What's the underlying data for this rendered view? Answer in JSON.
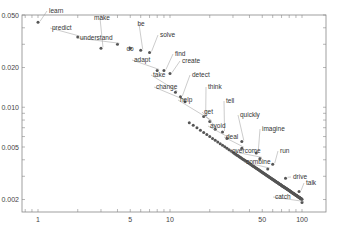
{
  "chart_data": {
    "type": "scatter",
    "title": "",
    "xlabel": "",
    "ylabel": "",
    "xscale": "log",
    "yscale": "log",
    "xlim": [
      0.78,
      130
    ],
    "ylim": [
      0.0014,
      0.066
    ],
    "grid": false,
    "x_ticks": [
      {
        "v": 1,
        "label": "1"
      },
      {
        "v": 5,
        "label": "5"
      },
      {
        "v": 10,
        "label": "10"
      },
      {
        "v": 50,
        "label": "50"
      },
      {
        "v": 100,
        "label": "100"
      }
    ],
    "y_ticks": [
      {
        "v": 0.05,
        "label": "0.050"
      },
      {
        "v": 0.02,
        "label": "0.020"
      },
      {
        "v": 0.01,
        "label": "0.010"
      },
      {
        "v": 0.005,
        "label": "0.005"
      },
      {
        "v": 0.002,
        "label": "0.002"
      }
    ],
    "point_color": "#555555",
    "series": [
      {
        "name": "words",
        "x_range": [
          1,
          100
        ],
        "approx_law": "y ≈ 0.046 * x^-0.68"
      }
    ],
    "labeled_points": [
      {
        "word": "learn",
        "x": 1,
        "y": 0.044,
        "lx": 49,
        "ly": 13,
        "anchor": "start"
      },
      {
        "word": "predict",
        "x": 2,
        "y": 0.034,
        "lx": 52,
        "ly": 30,
        "anchor": "start"
      },
      {
        "word": "make",
        "x": 3,
        "y": 0.028,
        "lx": 102,
        "ly": 20,
        "anchor": "middle"
      },
      {
        "word": "understand",
        "x": 4,
        "y": 0.03,
        "lx": 80,
        "ly": 40,
        "anchor": "start"
      },
      {
        "word": "do",
        "x": 5,
        "y": 0.028,
        "lx": 130,
        "ly": 51,
        "anchor": "middle"
      },
      {
        "word": "be",
        "x": 6,
        "y": 0.027,
        "lx": 141,
        "ly": 26,
        "anchor": "middle"
      },
      {
        "word": "solve",
        "x": 7,
        "y": 0.026,
        "lx": 160,
        "ly": 37,
        "anchor": "start"
      },
      {
        "word": "adapt",
        "x": 8,
        "y": 0.019,
        "lx": 134,
        "ly": 62,
        "anchor": "start"
      },
      {
        "word": "find",
        "x": 9,
        "y": 0.019,
        "lx": 175,
        "ly": 56,
        "anchor": "start"
      },
      {
        "word": "create",
        "x": 10,
        "y": 0.018,
        "lx": 182,
        "ly": 63,
        "anchor": "start"
      },
      {
        "word": "take",
        "x": 11,
        "y": 0.013,
        "lx": 153,
        "ly": 77,
        "anchor": "start"
      },
      {
        "word": "detect",
        "x": 12,
        "y": 0.012,
        "lx": 192,
        "ly": 77,
        "anchor": "start"
      },
      {
        "word": "change",
        "x": 13,
        "y": 0.011,
        "lx": 156,
        "ly": 89,
        "anchor": "start"
      },
      {
        "word": "think",
        "x": 18,
        "y": 0.0085,
        "lx": 208,
        "ly": 89,
        "anchor": "start"
      },
      {
        "word": "help",
        "x": 20,
        "y": 0.0078,
        "lx": 180,
        "ly": 102,
        "anchor": "start"
      },
      {
        "word": "tell",
        "x": 25,
        "y": 0.0065,
        "lx": 226,
        "ly": 103,
        "anchor": "start"
      },
      {
        "word": "get",
        "x": 22,
        "y": 0.0068,
        "lx": 204,
        "ly": 114,
        "anchor": "start"
      },
      {
        "word": "quickly",
        "x": 35,
        "y": 0.0055,
        "lx": 240,
        "ly": 117,
        "anchor": "start"
      },
      {
        "word": "avoid",
        "x": 27,
        "y": 0.0058,
        "lx": 210,
        "ly": 128,
        "anchor": "start"
      },
      {
        "word": "imagine",
        "x": 45,
        "y": 0.0045,
        "lx": 262,
        "ly": 131,
        "anchor": "start"
      },
      {
        "word": "deal",
        "x": 35,
        "y": 0.0049,
        "lx": 226,
        "ly": 139,
        "anchor": "start"
      },
      {
        "word": "run",
        "x": 60,
        "y": 0.0037,
        "lx": 280,
        "ly": 153,
        "anchor": "start"
      },
      {
        "word": "overcome",
        "x": 48,
        "y": 0.0041,
        "lx": 232,
        "ly": 153,
        "anchor": "start"
      },
      {
        "word": "combine",
        "x": 55,
        "y": 0.0034,
        "lx": 246,
        "ly": 164,
        "anchor": "start"
      },
      {
        "word": "drive",
        "x": 75,
        "y": 0.0029,
        "lx": 293,
        "ly": 179,
        "anchor": "start"
      },
      {
        "word": "talk",
        "x": 95,
        "y": 0.0023,
        "lx": 306,
        "ly": 185,
        "anchor": "start"
      },
      {
        "word": "catch",
        "x": 100,
        "y": 0.0019,
        "lx": 275,
        "ly": 199,
        "anchor": "start"
      }
    ]
  }
}
